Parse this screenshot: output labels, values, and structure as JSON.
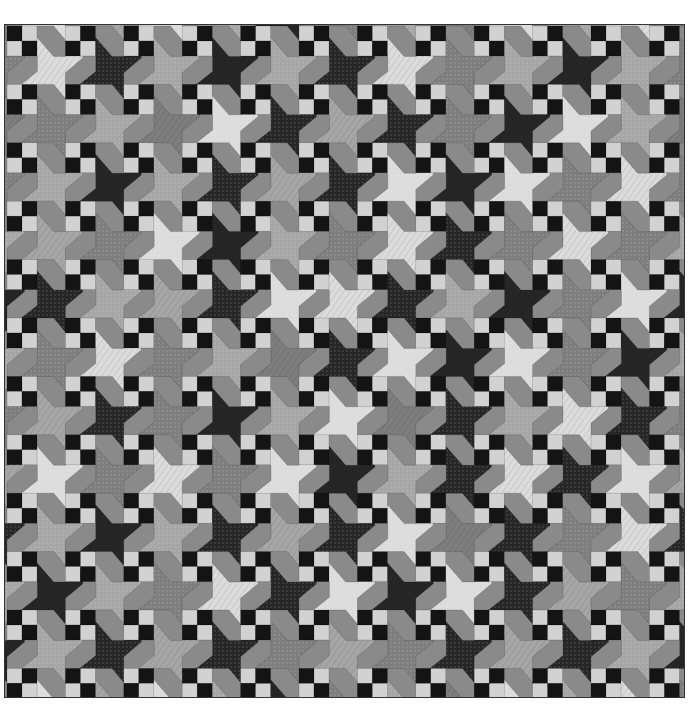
{
  "image": {
    "subject": "Black-and-white patchwork quilt with pinwheel stars and four-patch blocks",
    "quilt_bounds": {
      "x": 5,
      "y": 25,
      "width": 679,
      "height": 672
    },
    "grid": {
      "rows": 12,
      "cols": 12,
      "cell_size": 58.4,
      "fourpatch_size": 30
    }
  },
  "palette": {
    "L": "#dcdcdc",
    "M": "#a6a6a6",
    "G": "#7e7e7e",
    "D": "#262626",
    "patch_dark": "#141414",
    "patch_light": "#d2d2d2",
    "border": "#3a3a3a",
    "background": "#fefefe"
  },
  "star_tones": [
    [
      "L",
      "D",
      "M",
      "D",
      "M",
      "D",
      "L",
      "G",
      "M",
      "D",
      "M",
      "G"
    ],
    [
      "G",
      "M",
      "G",
      "L",
      "D",
      "M",
      "D",
      "G",
      "D",
      "L",
      "M",
      "G"
    ],
    [
      "M",
      "D",
      "M",
      "D",
      "M",
      "D",
      "L",
      "D",
      "L",
      "G",
      "L",
      "G"
    ],
    [
      "M",
      "G",
      "L",
      "D",
      "M",
      "G",
      "L",
      "D",
      "G",
      "L",
      "G",
      "M"
    ],
    [
      "D",
      "M",
      "M",
      "D",
      "L",
      "L",
      "D",
      "M",
      "D",
      "G",
      "L",
      "D"
    ],
    [
      "G",
      "L",
      "G",
      "M",
      "G",
      "D",
      "L",
      "D",
      "L",
      "G",
      "D",
      "M"
    ],
    [
      "M",
      "D",
      "G",
      "D",
      "M",
      "L",
      "G",
      "D",
      "M",
      "L",
      "D",
      "G"
    ],
    [
      "L",
      "G",
      "L",
      "G",
      "L",
      "D",
      "M",
      "D",
      "L",
      "D",
      "L",
      "M"
    ],
    [
      "M",
      "D",
      "M",
      "D",
      "M",
      "D",
      "L",
      "G",
      "D",
      "G",
      "L",
      "D"
    ],
    [
      "D",
      "M",
      "G",
      "L",
      "D",
      "L",
      "D",
      "L",
      "D",
      "M",
      "G",
      "M"
    ],
    [
      "M",
      "D",
      "M",
      "D",
      "G",
      "M",
      "G",
      "D",
      "M",
      "D",
      "M",
      "D"
    ],
    [
      "L",
      "M",
      "L",
      "M",
      "D",
      "G",
      "M",
      "G",
      "L",
      "M",
      "L",
      "G"
    ]
  ]
}
